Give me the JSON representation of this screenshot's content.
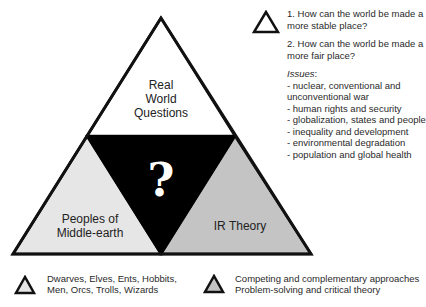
{
  "diagram": {
    "top_triangle": {
      "label_lines": [
        "Real",
        "World",
        "Questions"
      ],
      "fill": "#ffffff"
    },
    "center_triangle": {
      "label": "?",
      "fill": "#000000"
    },
    "left_triangle": {
      "label_lines": [
        "Peoples of",
        "Middle-earth"
      ],
      "fill": "#e6e6e6"
    },
    "right_triangle": {
      "label": "IR Theory",
      "fill": "#c4c4c4"
    }
  },
  "legend_top": {
    "icon": "triangle-outline-white-icon",
    "question_1_lines": [
      "1. How can the world be made a",
      "more stable place?"
    ],
    "question_2_lines": [
      "2. How can the world be made a",
      "more fair place?"
    ],
    "issues_title": "Issues",
    "issues_colon": ":",
    "issues": [
      "- nuclear, conventional and unconventional war",
      "- human rights and security",
      "- globalization, states and people",
      "- inequality and development",
      "- environmental degradation",
      "- population and global health"
    ]
  },
  "legend_bottom": [
    {
      "icon": "triangle-light-gray-icon",
      "fill": "#e6e6e6",
      "lines": [
        "Dwarves, Elves, Ents, Hobbits,",
        "Men, Orcs, Trolls, Wizards"
      ]
    },
    {
      "icon": "triangle-gray-icon",
      "fill": "#c4c4c4",
      "lines": [
        "Competing and complementary approaches",
        "Problem-solving and critical theory"
      ]
    }
  ]
}
